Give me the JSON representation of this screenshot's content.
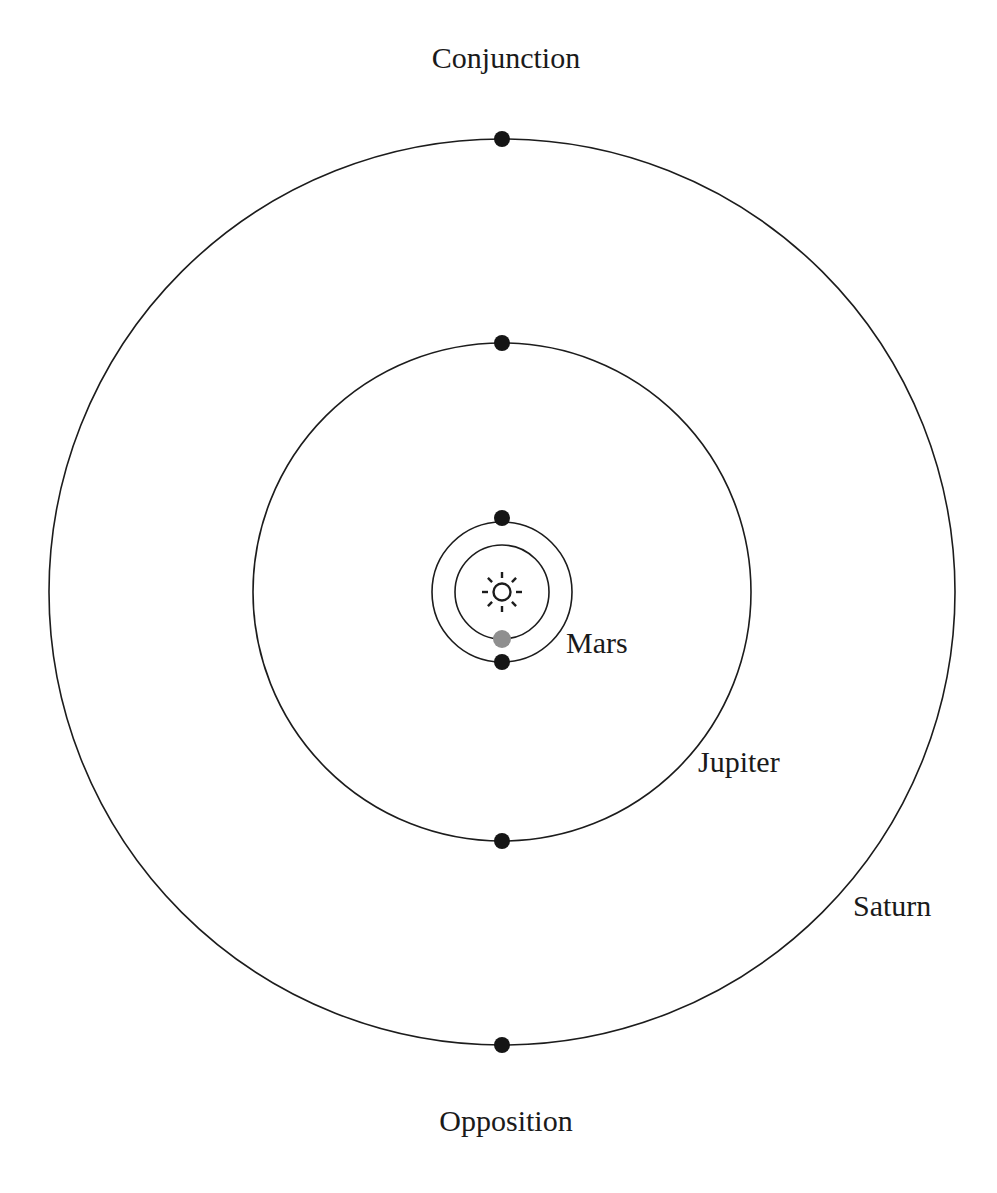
{
  "diagram": {
    "title_top": "Conjunction",
    "title_bottom": "Opposition",
    "background_color": "#ffffff",
    "stroke_color": "#1c1c1c",
    "center": {
      "x": 502,
      "y": 592
    },
    "sun": {
      "symbol_name": "sun-symbol",
      "radius": 9,
      "ray_count": 8,
      "ray_length": 6
    },
    "orbits": [
      {
        "name": "earth",
        "label": "",
        "radius": 47,
        "stroke": "#1c1c1c"
      },
      {
        "name": "mars",
        "label": "Mars",
        "radius": 70,
        "stroke": "#1c1c1c",
        "label_x": 566,
        "label_y": 653
      },
      {
        "name": "jupiter",
        "label": "Jupiter",
        "radius": 249,
        "stroke": "#1c1c1c",
        "label_x": 698,
        "label_y": 772
      },
      {
        "name": "saturn",
        "label": "Saturn",
        "radius": 453,
        "stroke": "#1c1c1c",
        "label_x": 853,
        "label_y": 916
      }
    ],
    "bodies": [
      {
        "name": "earth",
        "label": "",
        "color": "#8f8f8f",
        "radius": 9,
        "x": 502,
        "y": 639,
        "position": "below-sun-on-earth-orbit"
      },
      {
        "name": "mars-conjunction",
        "label": "Mars",
        "color": "#151515",
        "radius": 8,
        "x": 502,
        "y": 518,
        "position": "conjunction-top"
      },
      {
        "name": "mars-opposition",
        "label": "Mars",
        "color": "#151515",
        "radius": 8,
        "x": 502,
        "y": 662,
        "position": "opposition-bottom"
      },
      {
        "name": "jupiter-conjunction",
        "label": "Jupiter",
        "color": "#151515",
        "radius": 8,
        "x": 502,
        "y": 343,
        "position": "conjunction-top"
      },
      {
        "name": "jupiter-opposition",
        "label": "Jupiter",
        "color": "#151515",
        "radius": 8,
        "x": 502,
        "y": 841,
        "position": "opposition-bottom"
      },
      {
        "name": "saturn-conjunction",
        "label": "Saturn",
        "color": "#151515",
        "radius": 8,
        "x": 502,
        "y": 139,
        "position": "conjunction-top"
      },
      {
        "name": "saturn-opposition",
        "label": "Saturn",
        "color": "#151515",
        "radius": 8,
        "x": 502,
        "y": 1045,
        "position": "opposition-bottom"
      }
    ],
    "axis_labels": {
      "top": {
        "text": "Conjunction",
        "x": 506,
        "y": 68
      },
      "bottom": {
        "text": "Opposition",
        "x": 506,
        "y": 1131
      }
    }
  }
}
